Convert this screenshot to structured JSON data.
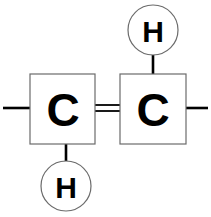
{
  "diagram": {
    "type": "chemical-structure",
    "background_color": "#ffffff",
    "stroke_color": "#000000",
    "outline_color": "#6b6b6b",
    "canvas": {
      "width": 211,
      "height": 217
    },
    "atoms": [
      {
        "id": "carbon-left",
        "element": "C",
        "label": "C",
        "shape": "square",
        "x": 62,
        "y": 109,
        "width": 65,
        "height": 70
      },
      {
        "id": "carbon-right",
        "element": "C",
        "label": "C",
        "shape": "square",
        "x": 153,
        "y": 109,
        "width": 66,
        "height": 70
      },
      {
        "id": "hydrogen-top",
        "element": "H",
        "label": "H",
        "shape": "circle",
        "x": 153,
        "y": 30,
        "radius": 25
      },
      {
        "id": "hydrogen-bottom",
        "element": "H",
        "label": "H",
        "shape": "circle",
        "x": 66,
        "y": 186,
        "radius": 25
      }
    ],
    "bonds": [
      {
        "id": "bond-cc-double",
        "from": "carbon-left",
        "to": "carbon-right",
        "order": 2,
        "orientation": "horizontal"
      },
      {
        "id": "bond-c-right-h-top",
        "from": "carbon-right",
        "to": "hydrogen-top",
        "order": 1,
        "orientation": "vertical"
      },
      {
        "id": "bond-c-left-h-bottom",
        "from": "carbon-left",
        "to": "hydrogen-bottom",
        "order": 1,
        "orientation": "vertical"
      }
    ],
    "open_bonds": [
      {
        "id": "open-bond-left",
        "from": "carbon-left",
        "direction": "left",
        "order": 1
      },
      {
        "id": "open-bond-right",
        "from": "carbon-right",
        "direction": "right",
        "order": 1
      }
    ]
  }
}
